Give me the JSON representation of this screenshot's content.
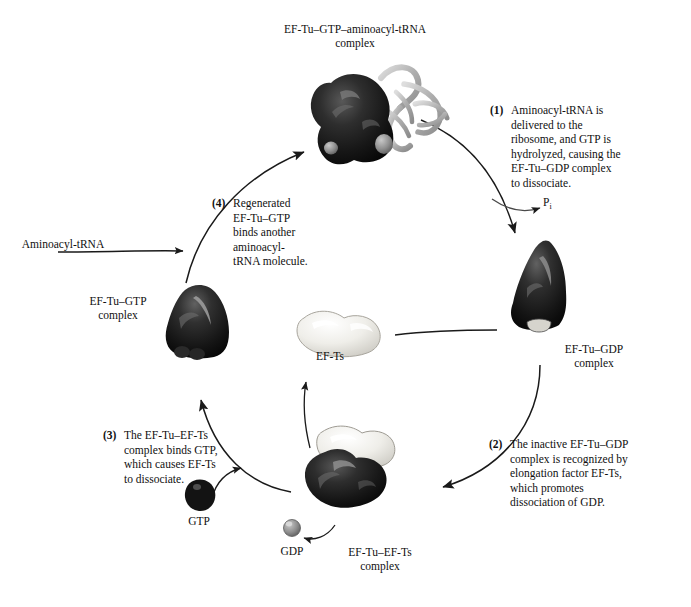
{
  "diagram": {
    "title_top": "EF-Tu–GTP–aminoacyl-tRNA\ncomplex",
    "labels": {
      "aminoacyl_trna": "Aminoacyl-tRNA",
      "ef_tu_gtp_complex": "EF-Tu–GTP\ncomplex",
      "ef_tu_gdp_complex": "EF-Tu–GDP\ncomplex",
      "ef_ts": "EF-Ts",
      "ef_tu_ef_ts_complex": "EF-Tu–EF-Ts\ncomplex",
      "gtp": "GTP",
      "gdp": "GDP",
      "phosphate": "P",
      "phosphate_subscript": "i"
    },
    "steps": [
      {
        "number": "(1)",
        "text": "Aminoacyl-tRNA is\ndelivered to the\nribosome, and GTP is\nhydrolyzed, causing the\nEF-Tu–GDP complex\nto dissociate."
      },
      {
        "number": "(2)",
        "text": "The inactive EF-Tu–GDP\ncomplex is recognized by\nelongation factor EF-Ts,\nwhich promotes\ndissociation of GDP."
      },
      {
        "number": "(3)",
        "text": "The EF-Tu–EF-Ts\ncomplex binds GTP,\nwhich causes EF-Ts\nto dissociate."
      },
      {
        "number": "(4)",
        "text": "Regenerated\nEF-Tu–GTP\nbinds another\naminoacyl-\ntRNA molecule."
      }
    ],
    "colors": {
      "protein_dark": "#1a1a1a",
      "protein_light": "#e8e7e2",
      "nucleotide_gray": "#8a8a8a",
      "trna_ribbon": "#b9b9b9",
      "arrow": "#1a1a1a",
      "background": "#ffffff"
    }
  }
}
